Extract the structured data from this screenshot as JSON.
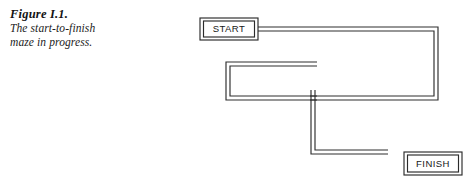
{
  "figure": {
    "caption": {
      "title": "Figure I.1.",
      "lines": [
        "The start-to-finish",
        "maze in progress."
      ]
    },
    "nodes": {
      "start": {
        "label": "START",
        "x": 200,
        "y": 18,
        "width": 58,
        "height": 22
      },
      "finish": {
        "label": "FINISH",
        "x": 404,
        "y": 152,
        "width": 58,
        "height": 23
      }
    },
    "maze": {
      "description": "start-to-finish maze in progress",
      "corridor_color": "#2e2e2e",
      "corridor_gap": 4,
      "paths": [
        {
          "name": "start-to-right-loop",
          "points": [
            [
              258,
              29
            ],
            [
              436,
              29
            ],
            [
              436,
              98
            ],
            [
              310,
              98
            ]
          ]
        },
        {
          "name": "inner-rectangle",
          "points": [
            [
              317,
              64
            ],
            [
              228,
              64
            ],
            [
              228,
              98
            ],
            [
              317,
              98
            ]
          ]
        },
        {
          "name": "descending-dead-end",
          "points": [
            [
              313,
              94
            ],
            [
              313,
              152
            ],
            [
              388,
              152
            ]
          ]
        }
      ]
    }
  }
}
